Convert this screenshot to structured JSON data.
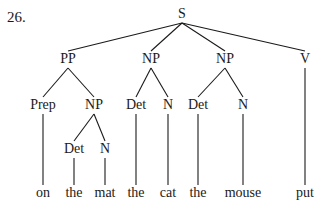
{
  "example_number": "26.",
  "tree": {
    "nodes": [
      {
        "id": "S",
        "label": "S",
        "x": 182,
        "y": 18
      },
      {
        "id": "PP",
        "label": "PP",
        "x": 68,
        "y": 63
      },
      {
        "id": "NP1",
        "label": "NP",
        "x": 151,
        "y": 63
      },
      {
        "id": "NP2",
        "label": "NP",
        "x": 225,
        "y": 63
      },
      {
        "id": "V",
        "label": "V",
        "x": 305,
        "y": 63
      },
      {
        "id": "Prep",
        "label": "Prep",
        "x": 43,
        "y": 109
      },
      {
        "id": "NP3",
        "label": "NP",
        "x": 94,
        "y": 109
      },
      {
        "id": "Det1",
        "label": "Det",
        "x": 136,
        "y": 109
      },
      {
        "id": "N1",
        "label": "N",
        "x": 168,
        "y": 109
      },
      {
        "id": "Det2",
        "label": "Det",
        "x": 198,
        "y": 109
      },
      {
        "id": "N2",
        "label": "N",
        "x": 243,
        "y": 109
      },
      {
        "id": "Det3",
        "label": "Det",
        "x": 74,
        "y": 153
      },
      {
        "id": "N3",
        "label": "N",
        "x": 105,
        "y": 153
      },
      {
        "id": "w_on",
        "label": "on",
        "x": 43,
        "y": 197
      },
      {
        "id": "w_the1",
        "label": "the",
        "x": 74,
        "y": 197
      },
      {
        "id": "w_mat",
        "label": "mat",
        "x": 105,
        "y": 197
      },
      {
        "id": "w_the2",
        "label": "the",
        "x": 136,
        "y": 197
      },
      {
        "id": "w_cat",
        "label": "cat",
        "x": 168,
        "y": 197
      },
      {
        "id": "w_the3",
        "label": "the",
        "x": 198,
        "y": 197
      },
      {
        "id": "w_mouse",
        "label": "mouse",
        "x": 243,
        "y": 197
      },
      {
        "id": "w_put",
        "label": "put",
        "x": 305,
        "y": 197
      }
    ],
    "edges": [
      [
        "S",
        "PP"
      ],
      [
        "S",
        "NP1"
      ],
      [
        "S",
        "NP2"
      ],
      [
        "S",
        "V"
      ],
      [
        "PP",
        "Prep"
      ],
      [
        "PP",
        "NP3"
      ],
      [
        "NP1",
        "Det1"
      ],
      [
        "NP1",
        "N1"
      ],
      [
        "NP2",
        "Det2"
      ],
      [
        "NP2",
        "N2"
      ],
      [
        "V",
        "w_put"
      ],
      [
        "Prep",
        "w_on"
      ],
      [
        "NP3",
        "Det3"
      ],
      [
        "NP3",
        "N3"
      ],
      [
        "Det3",
        "w_the1"
      ],
      [
        "N3",
        "w_mat"
      ],
      [
        "Det1",
        "w_the2"
      ],
      [
        "N1",
        "w_cat"
      ],
      [
        "Det2",
        "w_the3"
      ],
      [
        "N2",
        "w_mouse"
      ]
    ]
  }
}
